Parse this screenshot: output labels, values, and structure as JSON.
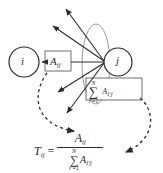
{
  "figure": {
    "type": "graph-normalization-diagram",
    "colors": {
      "stroke": "#2b2b2b",
      "light_stroke": "#9a9a9a",
      "background": "#ffffff"
    }
  },
  "nodes": [
    {
      "id": "i",
      "label": "i",
      "cx": 24,
      "cy": 62,
      "r": 15
    },
    {
      "id": "j",
      "label": "j",
      "cx": 118,
      "cy": 62,
      "r": 14
    }
  ],
  "boxes": [
    {
      "id": "edge-weight",
      "base": "A",
      "subscript": "ij",
      "x": 45,
      "y": 51,
      "w": 26,
      "h": 20
    },
    {
      "id": "degree-sum",
      "sigma": "∑",
      "sum_upper": "N",
      "sum_lower": "i′=1",
      "term_base": "A",
      "term_subscript": "i′j",
      "x": 86,
      "y": 78,
      "w": 56,
      "h": 22
    }
  ],
  "ellipse": {
    "id": "outgoing-edge-group",
    "cx": 96,
    "cy": 64,
    "rx": 14,
    "ry": 40
  },
  "formula": {
    "lhs_base": "T",
    "lhs_subscript": "ij",
    "equals": "=",
    "numerator_base": "A",
    "numerator_subscript": "ij",
    "denominator_sigma": "∑",
    "denominator_upper": "N",
    "denominator_lower": "i′=1",
    "denominator_base": "A",
    "denominator_subscript": "i′j",
    "plain_text": "T_ij = A_ij / sum_{i'=1}^{N} A_{i'j}"
  },
  "annotations": [
    {
      "id": "numerator-pointer",
      "from": "edge-weight",
      "to": "numerator",
      "style": "dashed-curved-arrow"
    },
    {
      "id": "denominator-pointer",
      "from": "degree-sum",
      "to": "denominator",
      "style": "dashed-curved-arrow"
    }
  ],
  "edges": [
    {
      "id": "edge-j-to-i",
      "from": "j",
      "to": "i",
      "style": "solid-arrow"
    },
    {
      "id": "edge-j-out-1",
      "from": "j",
      "to": "up-left-far",
      "style": "solid-arrow"
    },
    {
      "id": "edge-j-out-2",
      "from": "j",
      "to": "up-left",
      "style": "solid-arrow"
    },
    {
      "id": "edge-j-out-3",
      "from": "j",
      "to": "left-down",
      "style": "solid-arrow"
    },
    {
      "id": "edge-j-out-4",
      "from": "j",
      "to": "down-left",
      "style": "solid-arrow"
    }
  ]
}
